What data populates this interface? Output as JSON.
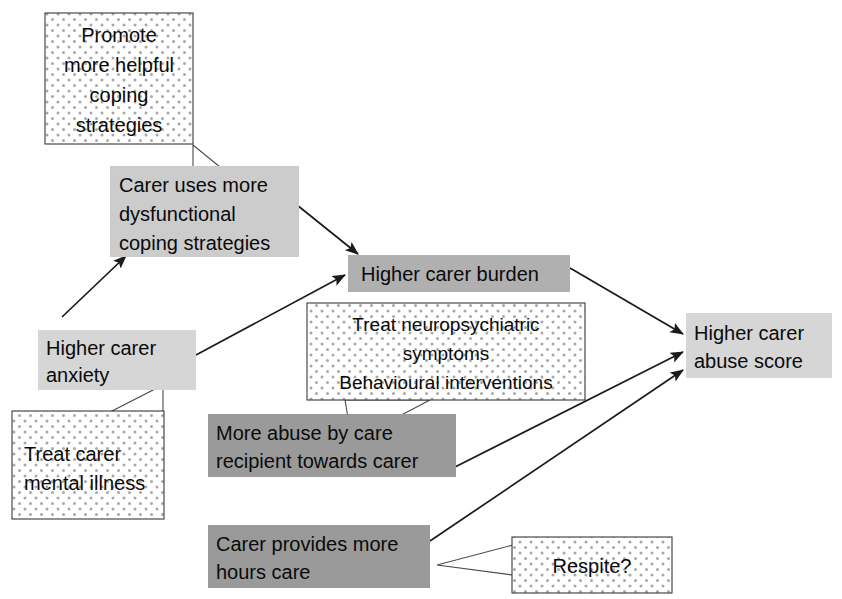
{
  "diagram": {
    "type": "flow-diagram",
    "canvas": {
      "width": 842,
      "height": 599,
      "background": "#ffffff"
    },
    "colors": {
      "light_gray_fill": "#d2d2d2",
      "mid_gray_fill": "#b8b8b8",
      "dark_gray_fill": "#9a9a9a",
      "callout_fill": "#ffffff",
      "callout_dot": "#a8a8a8",
      "outline": "#3a3a3a",
      "arrow": "#1a1a1a",
      "text": "#0a0a0a"
    },
    "nodes": [
      {
        "id": "promote-coping",
        "kind": "callout",
        "style": "dotted",
        "lines": [
          "Promote",
          "more helpful",
          "coping",
          "strategies"
        ],
        "align": "center"
      },
      {
        "id": "dysfunctional-coping",
        "kind": "box",
        "style": "light-gray",
        "lines": [
          "Carer uses more",
          "dysfunctional",
          "coping strategies"
        ],
        "align": "left"
      },
      {
        "id": "carer-burden",
        "kind": "box",
        "style": "mid-gray",
        "lines": [
          "Higher carer burden"
        ],
        "align": "left"
      },
      {
        "id": "carer-anxiety",
        "kind": "box",
        "style": "light-gray",
        "lines": [
          "Higher carer",
          "anxiety"
        ],
        "align": "left"
      },
      {
        "id": "treat-neuropsychiatric",
        "kind": "callout",
        "style": "dotted",
        "lines": [
          "Treat neuropsychiatric",
          "symptoms",
          "Behavioural interventions"
        ],
        "align": "center"
      },
      {
        "id": "treat-mental-illness",
        "kind": "callout",
        "style": "dotted",
        "lines": [
          "Treat carer",
          "mental illness"
        ],
        "align": "left"
      },
      {
        "id": "more-abuse-by-recipient",
        "kind": "box",
        "style": "dark-gray",
        "lines": [
          "More abuse by care",
          "recipient towards carer"
        ],
        "align": "left"
      },
      {
        "id": "more-hours-care",
        "kind": "box",
        "style": "dark-gray",
        "lines": [
          "Carer provides more",
          "hours care"
        ],
        "align": "left"
      },
      {
        "id": "respite",
        "kind": "callout",
        "style": "dotted",
        "lines": [
          "Respite?"
        ],
        "align": "center"
      },
      {
        "id": "carer-abuse-score",
        "kind": "box",
        "style": "light-gray",
        "lines": [
          "Higher carer",
          "abuse score"
        ],
        "align": "left"
      }
    ],
    "edges": [
      {
        "id": "anxiety-to-coping",
        "from": "carer-anxiety",
        "to": "dysfunctional-coping",
        "arrow": true
      },
      {
        "id": "coping-to-burden",
        "from": "dysfunctional-coping",
        "to": "carer-burden",
        "arrow": true
      },
      {
        "id": "anxiety-to-burden",
        "from": "carer-anxiety",
        "to": "carer-burden",
        "arrow": true
      },
      {
        "id": "burden-to-score",
        "from": "carer-burden",
        "to": "carer-abuse-score",
        "arrow": true
      },
      {
        "id": "abuse-to-score",
        "from": "more-abuse-by-recipient",
        "to": "carer-abuse-score",
        "arrow": true
      },
      {
        "id": "hours-to-score",
        "from": "more-hours-care",
        "to": "carer-abuse-score",
        "arrow": true
      }
    ],
    "callout_links": [
      {
        "id": "promote-tail",
        "from": "promote-coping",
        "to": "dysfunctional-coping"
      },
      {
        "id": "neuropsychiatric-tail",
        "from": "treat-neuropsychiatric",
        "to": "more-abuse-by-recipient"
      },
      {
        "id": "mental-illness-tail",
        "from": "treat-mental-illness",
        "to": "carer-anxiety"
      },
      {
        "id": "respite-tail",
        "from": "respite",
        "to": "more-hours-care"
      }
    ]
  }
}
